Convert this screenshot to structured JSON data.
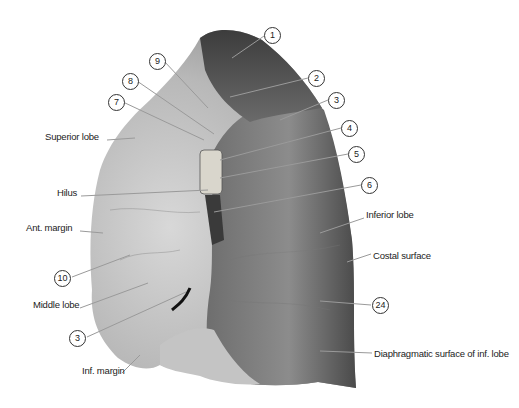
{
  "figure": {
    "text_labels": [
      {
        "id": "superior-lobe",
        "text": "Superior lobe",
        "x": 45,
        "y": 136
      },
      {
        "id": "hilus",
        "text": "Hilus",
        "x": 57,
        "y": 192
      },
      {
        "id": "ant-margin",
        "text": "Ant. margin",
        "x": 26,
        "y": 227
      },
      {
        "id": "middle-lobe",
        "text": "Middle lobe",
        "x": 33,
        "y": 304
      },
      {
        "id": "inf-margin",
        "text": "Inf. margin",
        "x": 82,
        "y": 369
      },
      {
        "id": "inferior-lobe",
        "text": "Inferior lobe",
        "x": 366,
        "y": 214
      },
      {
        "id": "costal-surface",
        "text": "Costal surface",
        "x": 373,
        "y": 250
      },
      {
        "id": "diaphragmatic-surface",
        "text": "Diaphragmatic surface of inf. lobe",
        "x": 374,
        "y": 349
      }
    ],
    "number_callouts": [
      {
        "id": "n1",
        "text": "1",
        "x": 264,
        "y": 27
      },
      {
        "id": "n2",
        "text": "2",
        "x": 308,
        "y": 70
      },
      {
        "id": "n3a",
        "text": "3",
        "x": 328,
        "y": 92
      },
      {
        "id": "n4",
        "text": "4",
        "x": 341,
        "y": 120
      },
      {
        "id": "n5",
        "text": "5",
        "x": 348,
        "y": 146
      },
      {
        "id": "n6",
        "text": "6",
        "x": 361,
        "y": 177
      },
      {
        "id": "n7",
        "text": "7",
        "x": 108,
        "y": 94
      },
      {
        "id": "n8",
        "text": "8",
        "x": 122,
        "y": 73
      },
      {
        "id": "n9",
        "text": "9",
        "x": 149,
        "y": 53
      },
      {
        "id": "n10",
        "text": "10",
        "x": 54,
        "y": 273
      },
      {
        "id": "n3b",
        "text": "3",
        "x": 69,
        "y": 333
      },
      {
        "id": "n24",
        "text": "24",
        "x": 372,
        "y": 297
      }
    ]
  }
}
